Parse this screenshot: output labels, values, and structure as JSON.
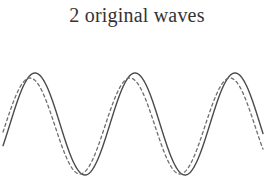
{
  "figure": {
    "title": "2 original waves",
    "background_color": "#ffffff"
  },
  "chart_data": {
    "type": "line",
    "title": "2 original waves",
    "subtitle": "",
    "xlabel": "",
    "ylabel": "",
    "grid": false,
    "legend": null,
    "axes_visible": false,
    "tick_labels": [],
    "xlim": [
      0,
      274
    ],
    "ylim": [
      -1.12,
      1.12
    ],
    "series": [
      {
        "name": "wave-1",
        "style": "solid",
        "color": "#4a4a4a",
        "line_width": 1.4,
        "amplitude": 1.0,
        "period_px": 100,
        "phase_px": 35,
        "baseline_y": 90,
        "amplitude_px": 51,
        "x_start": 3,
        "x_end": 263,
        "peaks_x": [
          35,
          135,
          235
        ],
        "troughs_x": [
          85,
          185
        ],
        "peak_y": 39,
        "trough_y": 141
      },
      {
        "name": "wave-2",
        "style": "dashed",
        "color": "#6e6e6e",
        "line_width": 1.3,
        "dash_pattern": "3,3",
        "amplitude": 0.94,
        "period_px": 100,
        "phase_px": 30,
        "baseline_y": 92,
        "amplitude_px": 48,
        "x_start": 3,
        "x_end": 263,
        "peaks_x": [
          30,
          130,
          230
        ],
        "troughs_x": [
          80,
          180
        ],
        "peak_y": 44,
        "trough_y": 143
      }
    ]
  }
}
